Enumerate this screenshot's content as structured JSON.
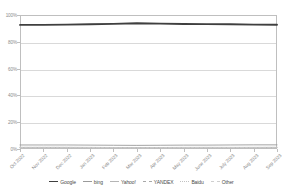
{
  "top_clip_text": "· · · · ·",
  "chart_data": {
    "type": "line",
    "title": "",
    "xlabel": "",
    "ylabel": "",
    "ylim": [
      0,
      100
    ],
    "y_ticks": [
      "0%",
      "20%",
      "40%",
      "60%",
      "80%",
      "100%"
    ],
    "y_tick_values": [
      0,
      20,
      40,
      60,
      80,
      100
    ],
    "grid": true,
    "legend_position": "bottom",
    "categories": [
      "Oct 2022",
      "Nov 2022",
      "Dec 2022",
      "Jan 2023",
      "Feb 2023",
      "Mar 2023",
      "Apr 2023",
      "May 2023",
      "June 2023",
      "July 2023",
      "Aug 2023",
      "Sep 2023"
    ],
    "series": [
      {
        "name": "Google",
        "color": "#3f3f3f",
        "width": 1.9,
        "dash": "none",
        "values": [
          92.6,
          92.6,
          92.8,
          93.1,
          93.4,
          93.8,
          93.6,
          93.3,
          93.2,
          93.1,
          92.8,
          92.7
        ]
      },
      {
        "name": "bing",
        "color": "#9a9a9a",
        "width": 0.9,
        "dash": "none",
        "values": [
          3.0,
          3.0,
          3.0,
          2.9,
          2.8,
          2.7,
          2.8,
          2.9,
          2.9,
          3.0,
          3.1,
          3.1
        ]
      },
      {
        "name": "Yahoo!",
        "color": "#b5b5b5",
        "width": 0.8,
        "dash": "none",
        "values": [
          1.2,
          1.2,
          1.2,
          1.2,
          1.1,
          1.1,
          1.1,
          1.2,
          1.2,
          1.2,
          1.2,
          1.2
        ]
      },
      {
        "name": "YANDEX",
        "color": "#a8a8a8",
        "width": 0.8,
        "dash": "2,1.2",
        "values": [
          1.1,
          1.1,
          1.0,
          1.0,
          1.0,
          0.9,
          0.9,
          0.9,
          0.9,
          0.9,
          1.0,
          1.0
        ]
      },
      {
        "name": "Baidu",
        "color": "#c2c2c2",
        "width": 0.8,
        "dash": "1.4,1.2",
        "values": [
          0.8,
          0.8,
          0.7,
          0.7,
          0.7,
          0.6,
          0.6,
          0.6,
          0.6,
          0.7,
          0.7,
          0.7
        ]
      },
      {
        "name": "Other",
        "color": "#cfcfcf",
        "width": 0.8,
        "dash": "3,1.5",
        "values": [
          1.3,
          1.3,
          1.3,
          1.1,
          1.0,
          0.9,
          1.0,
          1.1,
          1.2,
          1.1,
          1.2,
          1.3
        ]
      }
    ]
  },
  "legend": {
    "items": [
      {
        "label": "Google",
        "color": "#3f3f3f",
        "width": 1.8,
        "dash": "none"
      },
      {
        "label": "bing",
        "color": "#9a9a9a",
        "width": 1.0,
        "dash": "none"
      },
      {
        "label": "Yahoo!",
        "color": "#b5b5b5",
        "width": 0.8,
        "dash": "none"
      },
      {
        "label": "YANDEX",
        "color": "#a8a8a8",
        "width": 0.8,
        "dash": "dashed"
      },
      {
        "label": "Baidu",
        "color": "#c2c2c2",
        "width": 0.8,
        "dash": "dotted"
      },
      {
        "label": "Other",
        "color": "#cfcfcf",
        "width": 0.8,
        "dash": "dashed"
      }
    ]
  }
}
